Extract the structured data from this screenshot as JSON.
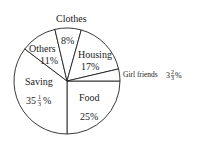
{
  "chart_data": {
    "type": "pie",
    "title": "",
    "unit": "%",
    "slices": [
      {
        "label": "Food",
        "value": 25,
        "display": "25%"
      },
      {
        "label": "Saving",
        "value": 35.333,
        "display": "35 1/3 %"
      },
      {
        "label": "Others",
        "value": 11,
        "display": "11%"
      },
      {
        "label": "Clothes",
        "value": 8,
        "display": "8%"
      },
      {
        "label": "Housing",
        "value": 17,
        "display": "17%"
      },
      {
        "label": "Girl friends",
        "value": 3.667,
        "display": "3 2/3 %"
      }
    ],
    "labels_outside": [
      "Clothes",
      "Girl friends"
    ],
    "legend": "none",
    "colors": {
      "fill": "#ffffff",
      "stroke": "#222222"
    }
  },
  "labels": {
    "food_name": "Food",
    "food_value": "25%",
    "saving_name": "Saving",
    "saving_whole": "35",
    "saving_num": "1",
    "saving_den": "3",
    "saving_pct": "%",
    "others_name": "Others",
    "others_value": "11%",
    "clothes_name": "Clothes",
    "clothes_value": "8%",
    "housing_name": "Housing",
    "housing_value": "17%",
    "girlfriends_name": "Girl friends",
    "girlfriends_whole": "3",
    "girlfriends_num": "2",
    "girlfriends_den": "3",
    "girlfriends_pct": "%"
  }
}
